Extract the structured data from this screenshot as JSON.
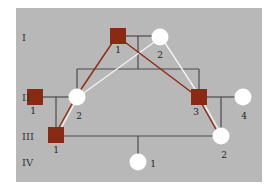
{
  "diagram": {
    "type": "pedigree",
    "colors": {
      "background": "#b8b8b8",
      "affected_male": "#8b2a12",
      "female": "#ffffff",
      "line": "#4a4a4a",
      "path_red": "#8b2a12",
      "path_white": "#f2f2f2"
    },
    "generations": [
      {
        "label": "I",
        "y": 37
      },
      {
        "label": "II",
        "y": 97
      },
      {
        "label": "III",
        "y": 136
      },
      {
        "label": "IV",
        "y": 162
      }
    ],
    "individuals": [
      {
        "id": "I-1",
        "shape": "square",
        "affected": true,
        "x": 118,
        "y": 36,
        "label": "1",
        "lx": 118,
        "ly": 53
      },
      {
        "id": "I-2",
        "shape": "circle",
        "affected": false,
        "x": 160,
        "y": 37,
        "label": "2",
        "lx": 160,
        "ly": 58
      },
      {
        "id": "II-1",
        "shape": "square",
        "affected": true,
        "x": 35,
        "y": 97,
        "label": "1",
        "lx": 33,
        "ly": 114
      },
      {
        "id": "II-2",
        "shape": "circle",
        "affected": false,
        "x": 77,
        "y": 97,
        "label": "2",
        "lx": 79,
        "ly": 119
      },
      {
        "id": "II-3",
        "shape": "square",
        "affected": true,
        "x": 199,
        "y": 97,
        "label": "3",
        "lx": 196,
        "ly": 115
      },
      {
        "id": "II-4",
        "shape": "circle",
        "affected": false,
        "x": 243,
        "y": 97,
        "label": "4",
        "lx": 244,
        "ly": 119
      },
      {
        "id": "III-1",
        "shape": "square",
        "affected": true,
        "x": 56,
        "y": 135,
        "label": "1",
        "lx": 56,
        "ly": 153
      },
      {
        "id": "III-2",
        "shape": "circle",
        "affected": false,
        "x": 221,
        "y": 136,
        "label": "2",
        "lx": 224,
        "ly": 158
      },
      {
        "id": "IV-1",
        "shape": "circle",
        "affected": false,
        "x": 138,
        "y": 162,
        "label": "1",
        "lx": 153,
        "ly": 167
      }
    ],
    "paths": {
      "red": [
        [
          "I-1",
          "II-2"
        ],
        [
          "II-2",
          "III-1"
        ],
        [
          "I-1",
          "II-3"
        ],
        [
          "II-3",
          "III-2"
        ]
      ],
      "white": [
        [
          "I-2",
          "II-2"
        ],
        [
          "II-2",
          "III-1"
        ],
        [
          "I-2",
          "II-3"
        ],
        [
          "II-3",
          "III-2"
        ]
      ]
    }
  }
}
